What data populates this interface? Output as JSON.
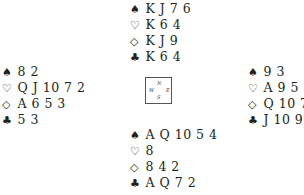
{
  "suits": {
    "spades": "♠",
    "hearts": "♡",
    "diamonds": "◇",
    "clubs": "♣"
  },
  "hands": {
    "north": {
      "spades": "K J 7 6",
      "hearts": "K 6 4",
      "diamonds": "K J 9",
      "clubs": "K 6 4"
    },
    "west": {
      "spades": "8 2",
      "hearts": "Q J 10 7 2",
      "diamonds": "A 6 5 3",
      "clubs": "5 3"
    },
    "east": {
      "spades": "9 3",
      "hearts": "A 9 5 3",
      "diamonds": "Q 10 7",
      "clubs": "J 10 9 8"
    },
    "south": {
      "spades": "A Q 10 5 4",
      "hearts": "8",
      "diamonds": "8 4 2",
      "clubs": "A Q 7 2"
    }
  },
  "compass": {
    "n": "N",
    "w": "W",
    "e": "E",
    "s": "S"
  }
}
